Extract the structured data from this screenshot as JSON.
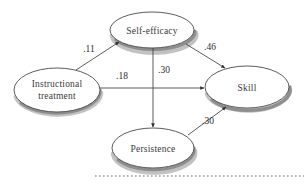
{
  "figure": {
    "type": "path-diagram",
    "background_color": "#ffffff",
    "line_color": "#3d3d3d",
    "text_color": "#3a3a3a",
    "shadow_color": "#8e8e8e"
  },
  "nodes": [
    {
      "id": "self_efficacy",
      "label": "Self-efficacy",
      "label_line1": "Self-efficacy",
      "label_line2": "",
      "cx": 152,
      "cy": 30,
      "rx": 42,
      "ry": 18
    },
    {
      "id": "instructional_treatment",
      "label": "Instructional treatment",
      "label_line1": "Instructional",
      "label_line2": "treatment",
      "cx": 57,
      "cy": 90,
      "rx": 43,
      "ry": 22
    },
    {
      "id": "skill",
      "label": "Skill",
      "label_line1": "Skill",
      "label_line2": "",
      "cx": 247,
      "cy": 87,
      "rx": 42,
      "ry": 21
    },
    {
      "id": "persistence",
      "label": "Persistence",
      "label_line1": "Persistence",
      "label_line2": "",
      "cx": 153,
      "cy": 148,
      "rx": 41,
      "ry": 20
    }
  ],
  "edges": [
    {
      "id": "edge-it-se",
      "from": "instructional_treatment",
      "to": "self_efficacy",
      "coefficient": ".11",
      "label_x": 89,
      "label_y": 52
    },
    {
      "id": "edge-it-skill",
      "from": "instructional_treatment",
      "to": "skill",
      "coefficient": ".18",
      "label_x": 122,
      "label_y": 79
    },
    {
      "id": "edge-se-skill",
      "from": "self_efficacy",
      "to": "skill",
      "coefficient": ".46",
      "label_x": 210,
      "label_y": 50
    },
    {
      "id": "edge-se-persistence",
      "from": "self_efficacy",
      "to": "persistence",
      "coefficient": ".30",
      "label_x": 164,
      "label_y": 73
    },
    {
      "id": "edge-persistence-skill",
      "from": "persistence",
      "to": "skill",
      "coefficient": ".30",
      "label_x": 208,
      "label_y": 124
    }
  ],
  "decorations": {
    "dotted_rule": {
      "name": "dotted-baseline",
      "x_start": 95,
      "x_end": 304,
      "y": 176
    }
  }
}
